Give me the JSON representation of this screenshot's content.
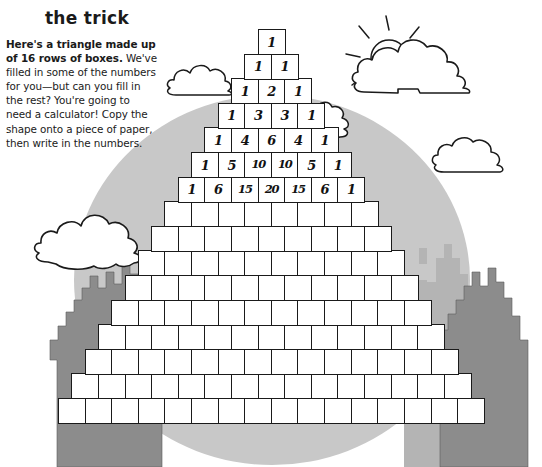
{
  "title": "the trick",
  "body": {
    "lead": "Here's a triangle made up of 16 rows of boxes.",
    "rest": " We've filled in some of the numbers for you—but can you fill in the rest? You're going to need a calculator! Copy the shape onto a piece of paper, then write in the numbers."
  },
  "puzzle": {
    "type": "pascals-triangle",
    "total_rows": 16,
    "filled_rows": 7,
    "rows": [
      [
        "1"
      ],
      [
        "1",
        "1"
      ],
      [
        "1",
        "2",
        "1"
      ],
      [
        "1",
        "3",
        "3",
        "1"
      ],
      [
        "1",
        "4",
        "6",
        "4",
        "1"
      ],
      [
        "1",
        "5",
        "10",
        "10",
        "5",
        "1"
      ],
      [
        "1",
        "6",
        "15",
        "20",
        "15",
        "6",
        "1"
      ],
      [
        "",
        "",
        "",
        "",
        "",
        "",
        "",
        ""
      ],
      [
        "",
        "",
        "",
        "",
        "",
        "",
        "",
        "",
        ""
      ],
      [
        "",
        "",
        "",
        "",
        "",
        "",
        "",
        "",
        "",
        ""
      ],
      [
        "",
        "",
        "",
        "",
        "",
        "",
        "",
        "",
        "",
        "",
        ""
      ],
      [
        "",
        "",
        "",
        "",
        "",
        "",
        "",
        "",
        "",
        "",
        "",
        ""
      ],
      [
        "",
        "",
        "",
        "",
        "",
        "",
        "",
        "",
        "",
        "",
        "",
        "",
        ""
      ],
      [
        "",
        "",
        "",
        "",
        "",
        "",
        "",
        "",
        "",
        "",
        "",
        "",
        "",
        ""
      ],
      [
        "",
        "",
        "",
        "",
        "",
        "",
        "",
        "",
        "",
        "",
        "",
        "",
        "",
        "",
        ""
      ],
      [
        "",
        "",
        "",
        "",
        "",
        "",
        "",
        "",
        "",
        "",
        "",
        "",
        "",
        "",
        "",
        ""
      ]
    ]
  },
  "scenery": {
    "sun": "sun-icon",
    "clouds": [
      "cloud-top-right",
      "cloud-mid-right",
      "cloud-left-upper",
      "cloud-left-lower",
      "cloud-behind-triangle"
    ],
    "mountains": [
      "mountain-left-dark",
      "mountain-right-light",
      "mountain-right-dark"
    ],
    "backdrop": "gray-circle-backdrop"
  },
  "colors": {
    "ink": "#1a1a1a",
    "paper": "#ffffff",
    "backdrop_gray": "#c8c8c8",
    "mountain_dark": "#8c8c8c",
    "mountain_light": "#b4b4b4"
  }
}
